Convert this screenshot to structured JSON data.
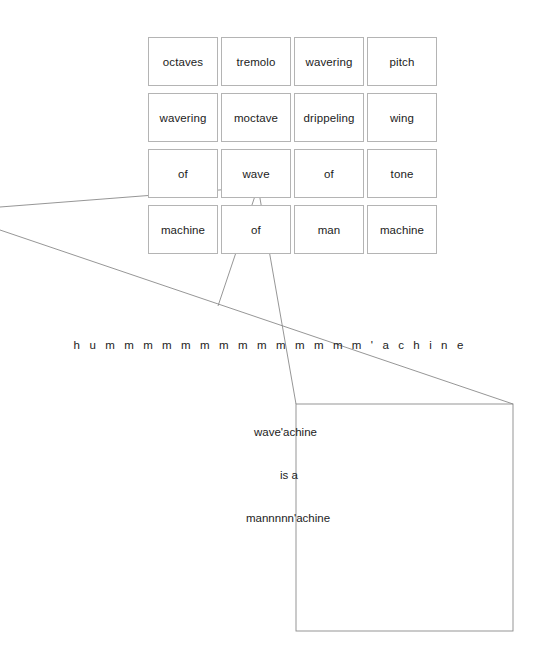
{
  "canvas": {
    "width": 540,
    "height": 652,
    "background": "#ffffff",
    "stroke_color": "#8a8a8a",
    "cell_border_color": "#b4b4b4",
    "text_color": "#1c1c1c"
  },
  "word_grid": {
    "rows": [
      [
        "octaves",
        "tremolo",
        "wavering",
        "pitch"
      ],
      [
        "wavering",
        "moctave",
        "drippeling",
        "wing"
      ],
      [
        "of",
        "wave",
        "of",
        "tone"
      ],
      [
        "machine",
        "of",
        "man",
        "machine"
      ]
    ]
  },
  "hum_line": {
    "text": "h u m m m m m m m m m m m m m m ' a c h i n e"
  },
  "stanza": {
    "lines": [
      "wave'achine",
      "is a",
      "mannnnn'achine"
    ]
  },
  "diagram": {
    "apex": {
      "x": 258,
      "y": 187
    },
    "box": {
      "x": 296,
      "y": 404,
      "width": 217,
      "height": 227
    },
    "lines": [
      {
        "name": "upper-left-ray",
        "x1": 0,
        "y1": 207,
        "x2": 258,
        "y2": 187
      },
      {
        "name": "lower-left-ray",
        "x1": 0,
        "y1": 230,
        "x2": 513,
        "y2": 404
      },
      {
        "name": "apex-left-leg",
        "x1": 258,
        "y1": 187,
        "x2": 218,
        "y2": 306
      },
      {
        "name": "apex-right-leg",
        "x1": 258,
        "y1": 187,
        "x2": 296,
        "y2": 404
      }
    ]
  }
}
